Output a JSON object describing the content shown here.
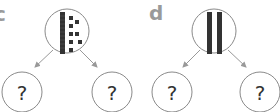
{
  "problems": [
    {
      "label": "c",
      "top_model": {
        "tens": 1,
        "ones": 8
      },
      "children": [
        "?",
        "?"
      ]
    },
    {
      "label": "d",
      "top_model": {
        "tens": 2,
        "ones": 0
      },
      "children": [
        "?",
        "?"
      ]
    }
  ],
  "colors": {
    "circle_stroke": "#8a8a8a",
    "arrow": "#999999",
    "block": "#333333",
    "label": "#9a9a9a"
  }
}
